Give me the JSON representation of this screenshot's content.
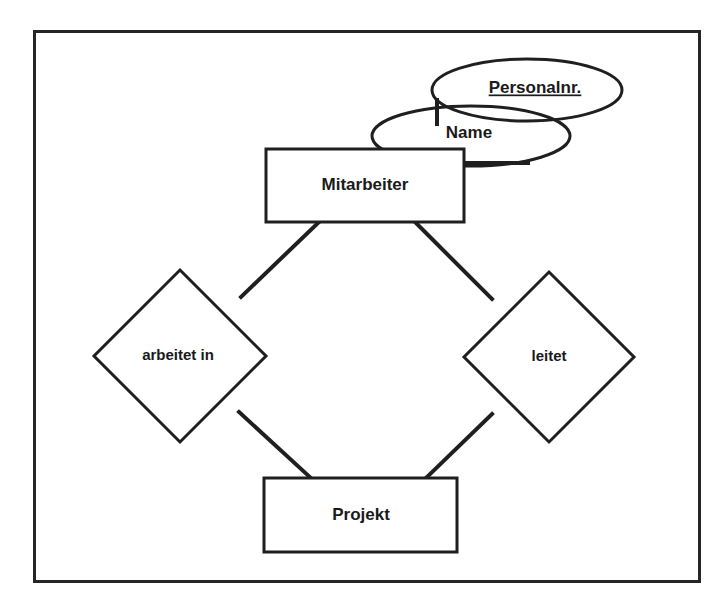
{
  "diagram": {
    "type": "entity-relationship-diagram",
    "notation": "Chen",
    "language": "de",
    "frame": {
      "x": 33,
      "y": 30,
      "width": 667,
      "height": 552
    },
    "colors": {
      "background": "#ffffff",
      "stroke": "#1f1f1f",
      "frame_stroke": "#262626",
      "text": "#1a1a1a"
    },
    "entities": [
      {
        "id": "mitarbeiter",
        "label": "Mitarbeiter",
        "shape": "rectangle",
        "x": 266,
        "y": 149,
        "width": 198,
        "height": 73
      },
      {
        "id": "projekt",
        "label": "Projekt",
        "shape": "rectangle",
        "x": 264,
        "y": 478,
        "width": 193,
        "height": 74
      }
    ],
    "relationships": [
      {
        "id": "arbeitet-in",
        "label": "arbeitet in",
        "shape": "diamond",
        "cx": 180,
        "cy": 356,
        "rx": 86,
        "ry": 86
      },
      {
        "id": "leitet",
        "label": "leitet",
        "shape": "diamond",
        "cx": 549,
        "cy": 357,
        "rx": 85,
        "ry": 85
      }
    ],
    "attributes": [
      {
        "id": "personalnr",
        "label": "Personalnr.",
        "shape": "ellipse",
        "is_key": true,
        "underlined": true,
        "cx": 527,
        "cy": 90,
        "rx": 95,
        "ry": 31,
        "belongs_to": "mitarbeiter"
      },
      {
        "id": "name",
        "label": "Name",
        "shape": "ellipse",
        "is_key": false,
        "underlined": false,
        "cx": 471,
        "cy": 136,
        "rx": 99,
        "ry": 30,
        "belongs_to": "mitarbeiter"
      }
    ],
    "connectors": [
      {
        "id": "mitarbeiter-arbeitet-in",
        "from": "mitarbeiter",
        "to": "arbeitet-in",
        "x1": 320,
        "y1": 222,
        "x2": 243,
        "y2": 296
      },
      {
        "id": "mitarbeiter-leitet",
        "from": "mitarbeiter",
        "to": "leitet",
        "x1": 414,
        "y1": 222,
        "x2": 490,
        "y2": 298
      },
      {
        "id": "arbeitet-in-projekt",
        "from": "arbeitet-in",
        "to": "projekt",
        "x1": 240,
        "y1": 412,
        "x2": 311,
        "y2": 478
      },
      {
        "id": "leitet-projekt",
        "from": "leitet",
        "to": "projekt",
        "x1": 492,
        "y1": 413,
        "x2": 426,
        "y2": 478
      },
      {
        "id": "mitarbeiter-name",
        "from": "mitarbeiter",
        "to": "name",
        "x1": 463,
        "y1": 163,
        "x2": 523,
        "y2": 163
      },
      {
        "id": "mitarbeiter-personalnr",
        "from": "mitarbeiter",
        "to": "personalnr",
        "x1": 437,
        "y1": 121,
        "x2": 437,
        "y2": 101
      }
    ]
  }
}
